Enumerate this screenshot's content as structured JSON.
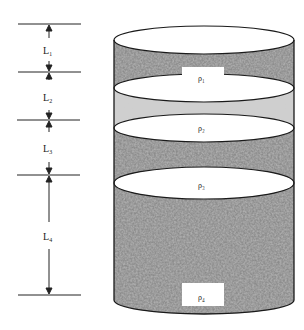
{
  "diagram": {
    "type": "layered-cylinder",
    "colors": {
      "outline": "#1a1a1a",
      "dark_texture": "#6e6e6e",
      "light_texture": "#c8c8c8",
      "ellipse_fill": "#ffffff",
      "dimension_line": "#222222"
    },
    "dimensions": [
      {
        "id": "L1",
        "label": "L₁"
      },
      {
        "id": "L2",
        "label": "L₂"
      },
      {
        "id": "L3",
        "label": "L₃"
      },
      {
        "id": "L4",
        "label": "L₄"
      }
    ],
    "layers": [
      {
        "id": "layer1",
        "density_label": "ρ₁",
        "shade": "dark"
      },
      {
        "id": "layer2",
        "density_label": "ρ₂",
        "shade": "light"
      },
      {
        "id": "layer3",
        "density_label": "ρ₃",
        "shade": "dark"
      },
      {
        "id": "layer4",
        "density_label": "ρ₄",
        "shade": "dark"
      }
    ]
  }
}
